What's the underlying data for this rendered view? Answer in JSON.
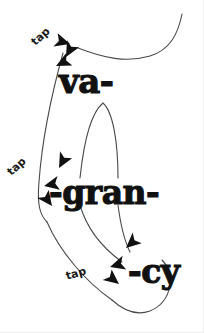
{
  "canvas": {
    "width": 204,
    "height": 333,
    "background": "#ffffff",
    "ink": "#111111",
    "line_color": "#4a4a4a",
    "border_color": "#ededed"
  },
  "artwork": {
    "title": "vagrancy",
    "description": "Hand-drawn diagram of the hyphenated word vagrancy with tap annotations",
    "style": "hand-drawn ink sketch"
  },
  "syllables": [
    {
      "id": "va",
      "label": "va-",
      "x": 59,
      "y": 64,
      "font_size": 34
    },
    {
      "id": "gran",
      "label": "-gran-",
      "x": 49,
      "y": 176,
      "font_size": 33
    },
    {
      "id": "cy",
      "label": "-cy",
      "x": 128,
      "y": 255,
      "font_size": 33
    }
  ],
  "annotations": [
    {
      "id": "tap-1",
      "label": "tap",
      "x": 33,
      "y": 38,
      "rotation": -42
    },
    {
      "id": "tap-2",
      "label": "tap",
      "x": 9,
      "y": 168,
      "rotation": -42
    },
    {
      "id": "tap-3",
      "label": "tap",
      "x": 66,
      "y": 271,
      "rotation": -16
    }
  ],
  "arrowheads": [
    {
      "id": "arrow-top-a",
      "x": 70,
      "y": 44,
      "rotation": 18
    },
    {
      "id": "arrow-top-b",
      "x": 66,
      "y": 57,
      "rotation": 120
    },
    {
      "id": "arrow-top-c",
      "x": 56,
      "y": 66,
      "rotation": 155
    },
    {
      "id": "arrow-mid-a",
      "x": 59,
      "y": 168,
      "rotation": 120
    },
    {
      "id": "arrow-mid-b",
      "x": 44,
      "y": 186,
      "rotation": 170
    },
    {
      "id": "arrow-mid-c",
      "x": 52,
      "y": 206,
      "rotation": 55
    },
    {
      "id": "arrow-bot-a",
      "x": 126,
      "y": 248,
      "rotation": 140
    },
    {
      "id": "arrow-bot-b",
      "x": 110,
      "y": 267,
      "rotation": 165
    },
    {
      "id": "arrow-bot-c",
      "x": 119,
      "y": 284,
      "rotation": 40
    }
  ],
  "strokes": [
    {
      "id": "stroke-top-sweep",
      "d": "M 182 14 C 178 34, 170 50, 150 56 C 126 63, 104 58, 78 48"
    },
    {
      "id": "stroke-left-long",
      "d": "M 63 53 C 50 100, 42 140, 39 182 C 37 205, 40 215, 47 222"
    },
    {
      "id": "stroke-left-lower",
      "d": "M 47 222 C 60 252, 86 282, 112 300"
    },
    {
      "id": "stroke-arch",
      "d": "M 80 178 C 84 140, 92 112, 103 103 C 113 112, 118 142, 118 178"
    },
    {
      "id": "stroke-descend-a",
      "d": "M 80 205 C 86 226, 100 246, 122 262"
    },
    {
      "id": "stroke-descend-b",
      "d": "M 118 205 C 121 228, 126 244, 130 252"
    },
    {
      "id": "stroke-bottom-loop",
      "d": "M 112 300 C 124 311, 136 316, 150 311 C 162 306, 168 296, 170 286 C 172 274, 168 266, 162 260"
    }
  ]
}
